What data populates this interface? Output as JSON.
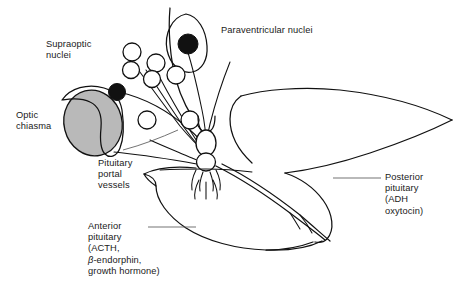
{
  "figure": {
    "background_color": "#ffffff",
    "line_color": "#111111",
    "chiasma_fill": "#b9b9b9"
  },
  "labels": {
    "supraoptic": {
      "line1": "Supraoptic",
      "line2": "nuclei"
    },
    "paraventricular": {
      "line1": "Paraventricular nuclei"
    },
    "optic_chiasma": {
      "line1": "Optic",
      "line2": "chiasma"
    },
    "portal_vessels": {
      "line1": "Pituitary",
      "line2": "portal",
      "line3": "vessels"
    },
    "anterior_pituitary": {
      "line1": "Anterior",
      "line2": "pituitary",
      "line3": "(ACTH,",
      "line4_beta": "β",
      "line4_rest": "-endorphin,",
      "line5": "growth hormone)"
    },
    "posterior_pituitary": {
      "line1": "Posterior",
      "line2": "pituitary",
      "line3": "(ADH",
      "line4": "oxytocin)"
    }
  },
  "structures": [
    {
      "name": "optic-chiasma",
      "kind": "filled-ellipse"
    },
    {
      "name": "supraoptic-nucleus",
      "kind": "outline-hook"
    },
    {
      "name": "paraventricular-nucleus",
      "kind": "outline-teardrop"
    },
    {
      "name": "neurosecretory-cell-bodies",
      "kind": "open-circles",
      "count": 7
    },
    {
      "name": "magnocellular-neurons",
      "kind": "filled-circles",
      "count": 2
    },
    {
      "name": "infundibular-stalk",
      "kind": "stacked-ovals",
      "count": 2
    },
    {
      "name": "median-eminence-capillaries",
      "kind": "branching-loops"
    },
    {
      "name": "anterior-pituitary-lobe",
      "kind": "outline-lobe"
    },
    {
      "name": "posterior-pituitary-lobe",
      "kind": "outline-lobe"
    },
    {
      "name": "hypothalamus-outline",
      "kind": "curved-outline"
    },
    {
      "name": "axon-tracts",
      "kind": "fan-lines"
    }
  ]
}
